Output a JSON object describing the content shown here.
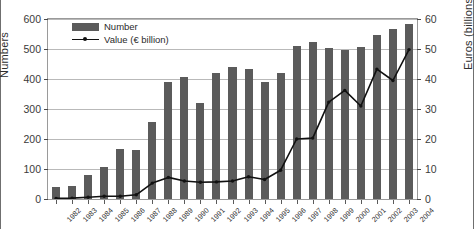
{
  "chart_data": {
    "type": "bar",
    "title": "",
    "xlabel": "",
    "ylabel": "Numbers",
    "ylabel_right": "Euros (billions)",
    "grid": true,
    "legend_position": "top-left",
    "categories": [
      "1982",
      "1983",
      "1984",
      "1985",
      "1986",
      "1987",
      "1988",
      "1989",
      "1990",
      "1991",
      "1992",
      "1993",
      "1994",
      "1995",
      "1996",
      "1997",
      "1998",
      "1999",
      "2000",
      "2001",
      "2002",
      "2003",
      "2004"
    ],
    "ylim": [
      0,
      600
    ],
    "yticks": [
      0,
      100,
      200,
      300,
      400,
      500,
      600
    ],
    "ylim_right": [
      0,
      60
    ],
    "yticks_right": [
      0,
      10,
      20,
      30,
      40,
      50,
      60
    ],
    "series": [
      {
        "name": "Number",
        "type": "bar",
        "axis": "left",
        "color": "#5b5b5b",
        "values": [
          40,
          43,
          80,
          108,
          168,
          163,
          258,
          390,
          408,
          320,
          421,
          440,
          435,
          391,
          421,
          511,
          522,
          505,
          497,
          507,
          546,
          568,
          584
        ]
      },
      {
        "name": "Value (€ billion)",
        "type": "line",
        "axis": "right",
        "color": "#111111",
        "values": [
          0.2,
          0.3,
          0.6,
          0.9,
          0.9,
          1.4,
          5.3,
          7.2,
          6.0,
          5.6,
          5.7,
          6.0,
          7.4,
          6.5,
          9.6,
          20.0,
          20.3,
          32.3,
          36.2,
          31.0,
          43.3,
          39.5,
          49.8
        ]
      }
    ]
  },
  "legend": {
    "entries": [
      {
        "label": "Number",
        "marker": "bar-swatch"
      },
      {
        "label": "Value (€ billion)",
        "marker": "line-swatch"
      }
    ]
  },
  "axes": {
    "left_title": "Numbers",
    "right_title": "Euros (billions)"
  }
}
